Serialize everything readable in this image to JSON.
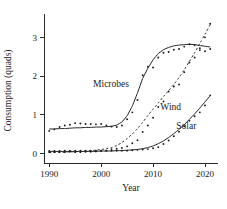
{
  "chart_data": {
    "type": "scatter",
    "title": "",
    "subtitle": "",
    "xlabel": "Year",
    "ylabel": "Consumption (quads)",
    "xlim": [
      1989,
      2022.5
    ],
    "ylim": [
      -0.25,
      3.5
    ],
    "xticks": [
      1990,
      2000,
      2010,
      2020
    ],
    "xticklabels": [
      "1990",
      "2000",
      "2010",
      "2020"
    ],
    "yticks": [
      0,
      1,
      2,
      3
    ],
    "yticklabels": [
      "0",
      "1",
      "2",
      "3"
    ],
    "grid": false,
    "legend_position": "inline-annotations",
    "annotations": [
      {
        "text": "Microbes",
        "x": 2001.9,
        "y": 1.72
      },
      {
        "text": "Wind",
        "x": 2013.4,
        "y": 1.12
      },
      {
        "text": "Solar",
        "x": 2016.4,
        "y": 0.62
      }
    ],
    "series": [
      {
        "name": "Microbes",
        "style": "solid-fit-with-points",
        "x": [
          1990,
          1991,
          1992,
          1993,
          1994,
          1995,
          1996,
          1997,
          1998,
          1999,
          2000,
          2001,
          2002,
          2003,
          2004,
          2005,
          2006,
          2007,
          2008,
          2009,
          2010,
          2011,
          2012,
          2013,
          2014,
          2015,
          2016,
          2017,
          2018,
          2019,
          2020,
          2021
        ],
        "values": [
          0.58,
          0.62,
          0.68,
          0.72,
          0.74,
          0.78,
          0.77,
          0.76,
          0.76,
          0.75,
          0.76,
          0.72,
          0.69,
          0.68,
          0.72,
          0.88,
          1.06,
          1.38,
          2.02,
          2.24,
          2.22,
          2.48,
          2.6,
          2.62,
          2.68,
          2.7,
          2.76,
          2.82,
          2.8,
          2.72,
          2.64,
          2.7
        ],
        "fit": [
          0.63,
          0.63,
          0.64,
          0.64,
          0.65,
          0.66,
          0.66,
          0.67,
          0.67,
          0.68,
          0.68,
          0.69,
          0.7,
          0.73,
          0.81,
          0.97,
          1.22,
          1.56,
          1.94,
          2.2,
          2.42,
          2.58,
          2.68,
          2.74,
          2.78,
          2.8,
          2.81,
          2.82,
          2.81,
          2.79,
          2.77,
          2.75
        ]
      },
      {
        "name": "Wind",
        "style": "dashed-fit-with-points",
        "x": [
          1990,
          1991,
          1992,
          1993,
          1994,
          1995,
          1996,
          1997,
          1998,
          1999,
          2000,
          2001,
          2002,
          2003,
          2004,
          2005,
          2006,
          2007,
          2008,
          2009,
          2010,
          2011,
          2012,
          2013,
          2014,
          2015,
          2016,
          2017,
          2018,
          2019,
          2020,
          2021
        ],
        "values": [
          0.03,
          0.03,
          0.03,
          0.03,
          0.04,
          0.03,
          0.03,
          0.04,
          0.04,
          0.05,
          0.06,
          0.07,
          0.11,
          0.12,
          0.14,
          0.18,
          0.26,
          0.34,
          0.55,
          0.72,
          0.92,
          1.2,
          1.34,
          1.6,
          1.73,
          1.78,
          2.1,
          2.35,
          2.48,
          2.67,
          3.0,
          3.35
        ],
        "fit": [
          0.02,
          0.02,
          0.03,
          0.03,
          0.04,
          0.04,
          0.05,
          0.06,
          0.07,
          0.08,
          0.1,
          0.12,
          0.15,
          0.2,
          0.28,
          0.38,
          0.5,
          0.64,
          0.8,
          0.98,
          1.14,
          1.3,
          1.47,
          1.62,
          1.78,
          1.96,
          2.16,
          2.38,
          2.6,
          2.84,
          3.08,
          3.33
        ]
      },
      {
        "name": "Solar",
        "style": "solid-fit-with-points",
        "x": [
          1990,
          1991,
          1992,
          1993,
          1994,
          1995,
          1996,
          1997,
          1998,
          1999,
          2000,
          2001,
          2002,
          2003,
          2004,
          2005,
          2006,
          2007,
          2008,
          2009,
          2010,
          2011,
          2012,
          2013,
          2014,
          2015,
          2016,
          2017,
          2018,
          2019,
          2020,
          2021
        ],
        "values": [
          0.06,
          0.06,
          0.06,
          0.07,
          0.07,
          0.07,
          0.07,
          0.07,
          0.07,
          0.07,
          0.07,
          0.07,
          0.07,
          0.07,
          0.07,
          0.07,
          0.08,
          0.09,
          0.1,
          0.11,
          0.13,
          0.16,
          0.24,
          0.33,
          0.44,
          0.56,
          0.7,
          0.84,
          0.96,
          1.06,
          1.24,
          1.5
        ],
        "fit": [
          0.05,
          0.05,
          0.05,
          0.05,
          0.05,
          0.05,
          0.05,
          0.05,
          0.05,
          0.05,
          0.06,
          0.06,
          0.06,
          0.07,
          0.07,
          0.08,
          0.09,
          0.1,
          0.12,
          0.15,
          0.19,
          0.25,
          0.32,
          0.41,
          0.51,
          0.62,
          0.74,
          0.88,
          1.02,
          1.17,
          1.33,
          1.49
        ]
      }
    ]
  }
}
